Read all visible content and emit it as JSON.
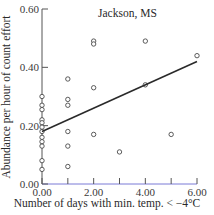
{
  "chart_data": {
    "type": "scatter",
    "title": "Jackson, MS",
    "xlabel": "Number of days with min. temp. < −4°C",
    "ylabel": "Abundance per hour of count effort",
    "xlim": [
      0,
      6
    ],
    "ylim": [
      0,
      0.6
    ],
    "x_ticks": [
      0,
      2,
      4,
      6
    ],
    "x_tick_labels": [
      "0.00",
      "2.00",
      "4.00",
      "6.00"
    ],
    "x_minor_ticks": [
      1,
      3,
      5
    ],
    "y_ticks": [
      0,
      0.2,
      0.4,
      0.6
    ],
    "y_tick_labels": [
      "0.00",
      "0.20",
      "0.40",
      "0.60"
    ],
    "grid": false,
    "legend": null,
    "marker": "open-circle",
    "series": [
      {
        "name": "observations",
        "points": [
          {
            "x": 0,
            "y": 0.3
          },
          {
            "x": 0,
            "y": 0.27
          },
          {
            "x": 0,
            "y": 0.255
          },
          {
            "x": 0,
            "y": 0.22
          },
          {
            "x": 0,
            "y": 0.21
          },
          {
            "x": 0,
            "y": 0.195
          },
          {
            "x": 0,
            "y": 0.18
          },
          {
            "x": 0,
            "y": 0.16
          },
          {
            "x": 0,
            "y": 0.145
          },
          {
            "x": 0,
            "y": 0.13
          },
          {
            "x": 0,
            "y": 0.08
          },
          {
            "x": 0,
            "y": 0.05
          },
          {
            "x": 1,
            "y": 0.36
          },
          {
            "x": 1,
            "y": 0.29
          },
          {
            "x": 1,
            "y": 0.27
          },
          {
            "x": 1,
            "y": 0.18
          },
          {
            "x": 1,
            "y": 0.13
          },
          {
            "x": 1,
            "y": 0.06
          },
          {
            "x": 2,
            "y": 0.49
          },
          {
            "x": 2,
            "y": 0.48
          },
          {
            "x": 2,
            "y": 0.33
          },
          {
            "x": 2,
            "y": 0.17
          },
          {
            "x": 3,
            "y": 0.11
          },
          {
            "x": 4,
            "y": 0.49
          },
          {
            "x": 4,
            "y": 0.34
          },
          {
            "x": 5,
            "y": 0.17
          },
          {
            "x": 6,
            "y": 0.44
          }
        ]
      },
      {
        "name": "regression line",
        "type": "line",
        "x": [
          0,
          6
        ],
        "values": [
          0.18,
          0.42
        ]
      }
    ],
    "colors": {
      "axis": "#555555",
      "x_axis": "#7b7bd6",
      "points": "#4a4a4a",
      "line": "#2a2a2a"
    }
  }
}
